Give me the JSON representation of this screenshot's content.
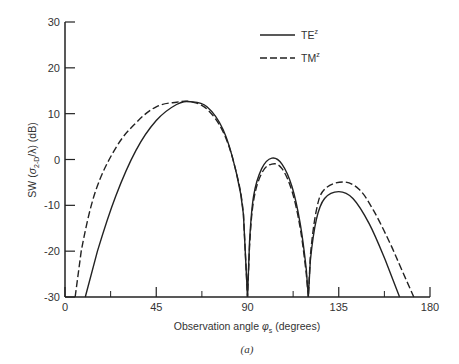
{
  "chart_data": {
    "type": "line",
    "title": "",
    "caption": "(a)",
    "xlabel": "Observation angle φs (degrees)",
    "ylabel": "SW (σ2-D/λ) (dB)",
    "xlim": [
      0,
      180
    ],
    "ylim": [
      -30,
      30
    ],
    "xticks": [
      0,
      45,
      90,
      135,
      180
    ],
    "yticks": [
      -30,
      -20,
      -10,
      0,
      10,
      20,
      30
    ],
    "grid": false,
    "legend_position": "upper right",
    "series": [
      {
        "name": "TE^z",
        "style": "solid",
        "x": [
          10,
          16,
          25,
          35,
          45,
          55,
          62,
          70,
          78,
          84,
          88,
          90,
          91,
          93,
          97,
          102,
          107,
          112,
          116,
          119,
          120,
          121,
          124,
          128,
          135,
          142,
          150,
          158,
          165
        ],
        "y": [
          -30,
          -20,
          -8,
          2,
          8.5,
          12,
          12.6,
          11.5,
          6.5,
          -2,
          -12,
          -30,
          -18,
          -8,
          -2,
          0.3,
          -1,
          -6,
          -14,
          -24,
          -30,
          -22,
          -13,
          -8.5,
          -7,
          -8.5,
          -14,
          -22,
          -30
        ]
      },
      {
        "name": "TM^z",
        "style": "dashed",
        "x": [
          5,
          8,
          15,
          25,
          35,
          45,
          55,
          62,
          70,
          78,
          84,
          88,
          90,
          91,
          93,
          97,
          102,
          107,
          112,
          116,
          119,
          120,
          121,
          124,
          128,
          137,
          145,
          152,
          160,
          166,
          172
        ],
        "y": [
          -30,
          -20,
          -7,
          2.5,
          8,
          11.5,
          12.5,
          12.6,
          11,
          6,
          -2,
          -12,
          -30,
          -19,
          -9,
          -3,
          -1,
          -2,
          -7,
          -15,
          -25,
          -30,
          -21,
          -11,
          -6.5,
          -4.9,
          -6.5,
          -11,
          -18,
          -24,
          -30
        ]
      }
    ]
  },
  "legend": {
    "te_label": "TE",
    "te_sup": "z",
    "tm_label": "TM",
    "tm_sup": "z"
  },
  "axes": {
    "xlabel_main": "Observation angle ",
    "xlabel_symbol": "φ",
    "xlabel_sub": "s",
    "xlabel_unit": " (degrees)",
    "ylabel_main": "SW (",
    "ylabel_symbol": "σ",
    "ylabel_sub": "2-D",
    "ylabel_unit": "/λ) (dB)"
  },
  "caption": "(a)"
}
